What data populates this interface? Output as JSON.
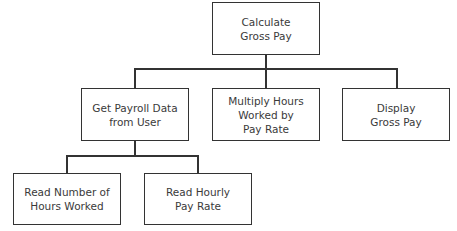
{
  "diagram": {
    "type": "hierarchy-chart",
    "root": {
      "lines": [
        "Calculate",
        "Gross Pay"
      ]
    },
    "level1": [
      {
        "lines": [
          "Get Payroll Data",
          "from User"
        ]
      },
      {
        "lines": [
          "Multiply Hours",
          "Worked by",
          "Pay Rate"
        ]
      },
      {
        "lines": [
          "Display",
          "Gross Pay"
        ]
      }
    ],
    "level2": [
      {
        "lines": [
          "Read Number of",
          "Hours Worked"
        ]
      },
      {
        "lines": [
          "Read Hourly",
          "Pay Rate"
        ]
      }
    ],
    "colors": {
      "line": "#333333",
      "text": "#3a3a3a",
      "background": "#ffffff"
    }
  }
}
